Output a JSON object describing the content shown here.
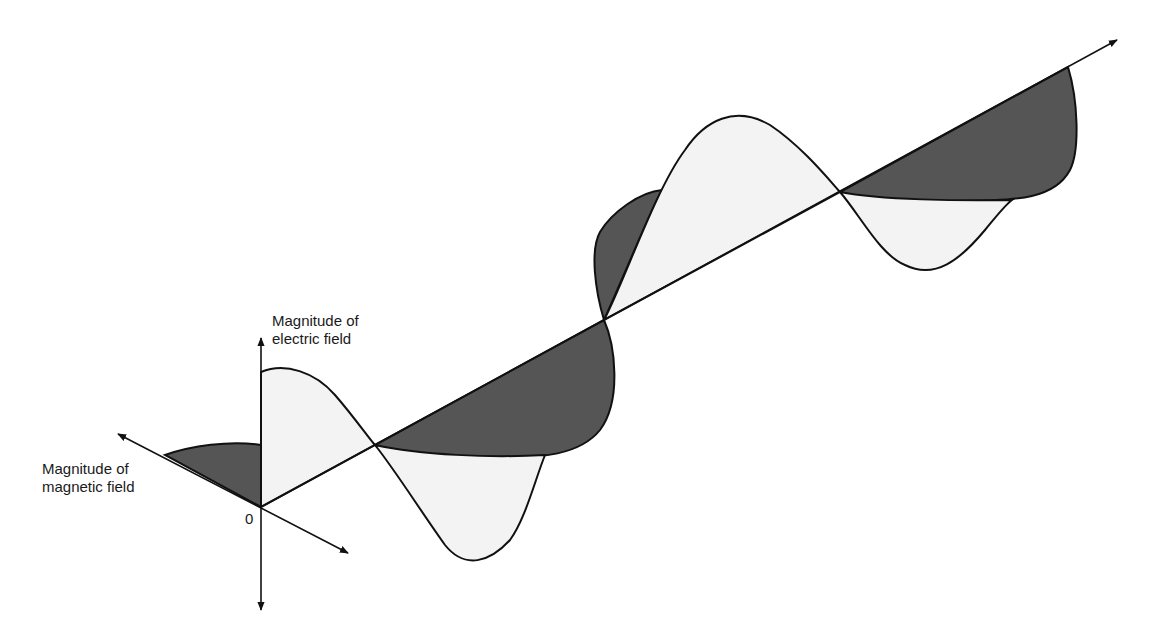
{
  "diagram": {
    "labels": {
      "electric_field": {
        "line1": "Magnitude of",
        "line2": "electric field"
      },
      "magnetic_field": {
        "line1": "Magnitude of",
        "line2": "magnetic field"
      },
      "origin": "0"
    },
    "colors": {
      "stroke": "#111111",
      "electric_fill": "#f3f3f3",
      "magnetic_fill": "#555555",
      "background": "#ffffff"
    },
    "components": [
      {
        "name": "Electric field wave",
        "fill": "light",
        "plane": "vertical"
      },
      {
        "name": "Magnetic field wave",
        "fill": "dark",
        "plane": "horizontal"
      },
      {
        "name": "Propagation axis",
        "direction": "upper-right"
      }
    ]
  }
}
